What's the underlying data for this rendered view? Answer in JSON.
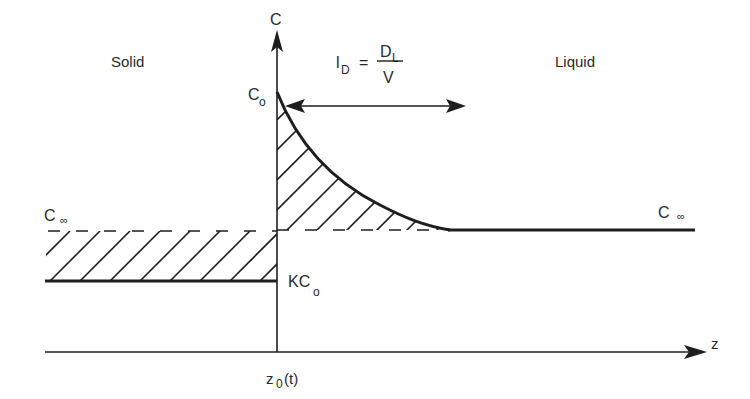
{
  "diagram": {
    "type": "solidification-solute-profile",
    "regions": {
      "solid_label": "Solid",
      "liquid_label": "Liquid"
    },
    "axes": {
      "y_label": "C",
      "x_label": "z",
      "interface_label_main": "z",
      "interface_label_sub": "0",
      "interface_label_suffix": "(t)"
    },
    "levels": {
      "c0_main": "C",
      "c0_sub": "o",
      "cinf_left_main": "C",
      "cinf_left_sub": "∞",
      "cinf_right_main": "C",
      "cinf_right_sub": "∞",
      "kc0_main": "KC",
      "kc0_sub": "o"
    },
    "formula": {
      "lhs_main": "l",
      "lhs_sub": "D",
      "equals": "=",
      "numerator_main": "D",
      "numerator_sub": "L",
      "denominator": "V"
    },
    "colors": {
      "line": "#1e1e1e",
      "text": "#2a2a2a",
      "background": "#ffffff"
    }
  }
}
